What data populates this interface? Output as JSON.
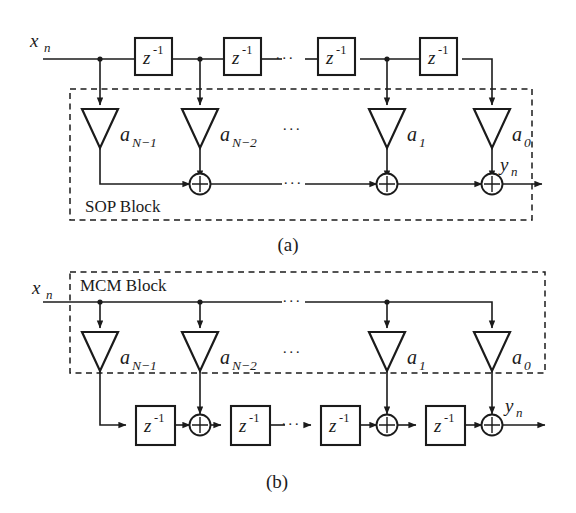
{
  "figure": {
    "background_color": "#ffffff",
    "line_color": "#1b1b1b"
  },
  "labels": {
    "input": "x",
    "input_sub": "n",
    "output": "y",
    "output_sub": "n",
    "delay_symbol": "z",
    "delay_exponent": "-1",
    "ellipsis": "···",
    "coeff_symbol": "a"
  },
  "panel_a": {
    "caption": "(a)",
    "block_label": "SOP Block",
    "input_label": "x",
    "input_label_sub": "n",
    "output_label": "y",
    "output_label_sub": "n",
    "delays": [
      {
        "symbol": "z",
        "exponent": "-1"
      },
      {
        "symbol": "z",
        "exponent": "-1"
      },
      {
        "symbol": "z",
        "exponent": "-1"
      },
      {
        "symbol": "z",
        "exponent": "-1"
      }
    ],
    "coefficients": [
      {
        "base": "a",
        "sub": "N−1"
      },
      {
        "base": "a",
        "sub": "N−2"
      },
      {
        "base": "a",
        "sub": "1"
      },
      {
        "base": "a",
        "sub": "0"
      }
    ],
    "adders": 3,
    "ellipses": [
      "···",
      "···",
      "···"
    ]
  },
  "panel_b": {
    "caption": "(b)",
    "block_label": "MCM Block",
    "input_label": "x",
    "input_label_sub": "n",
    "output_label": "y",
    "output_label_sub": "n",
    "delays": [
      {
        "symbol": "z",
        "exponent": "-1"
      },
      {
        "symbol": "z",
        "exponent": "-1"
      },
      {
        "symbol": "z",
        "exponent": "-1"
      },
      {
        "symbol": "z",
        "exponent": "-1"
      }
    ],
    "coefficients": [
      {
        "base": "a",
        "sub": "N−1"
      },
      {
        "base": "a",
        "sub": "N−2"
      },
      {
        "base": "a",
        "sub": "1"
      },
      {
        "base": "a",
        "sub": "0"
      }
    ],
    "adders": 3,
    "ellipses": [
      "···",
      "···",
      "···"
    ]
  }
}
